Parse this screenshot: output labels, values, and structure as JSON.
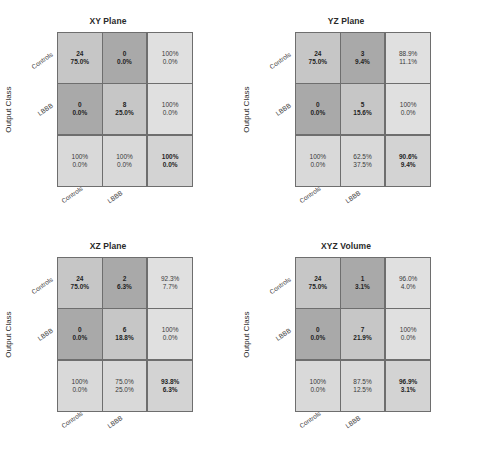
{
  "page": {
    "header_text": "",
    "y_axis_label": "Output Class",
    "class_labels": [
      "Controls",
      "LBBB"
    ]
  },
  "chart_data": {
    "type": "table",
    "xlabel": "Target Class",
    "ylabel": "Output Class",
    "categories": [
      "Controls",
      "LBBB"
    ],
    "legend": [],
    "panels": [
      {
        "title": "XY Plane",
        "cells": [
          [
            {
              "v1": "24",
              "v2": "75.0%",
              "shade": "diag"
            },
            {
              "v1": "0",
              "v2": "0.0%",
              "shade": "off"
            },
            {
              "v1": "100%",
              "v2": "0.0%",
              "shade": "margin-lt"
            }
          ],
          [
            {
              "v1": "0",
              "v2": "0.0%",
              "shade": "off"
            },
            {
              "v1": "8",
              "v2": "25.0%",
              "shade": "diag"
            },
            {
              "v1": "100%",
              "v2": "0.0%",
              "shade": "margin-lt"
            }
          ],
          [
            {
              "v1": "100%",
              "v2": "0.0%",
              "shade": "margin"
            },
            {
              "v1": "100%",
              "v2": "0.0%",
              "shade": "margin"
            },
            {
              "v1": "100%",
              "v2": "0.0%",
              "shade": "total"
            }
          ]
        ]
      },
      {
        "title": "YZ Plane",
        "cells": [
          [
            {
              "v1": "24",
              "v2": "75.0%",
              "shade": "diag"
            },
            {
              "v1": "3",
              "v2": "9.4%",
              "shade": "off"
            },
            {
              "v1": "88.9%",
              "v2": "11.1%",
              "shade": "margin-lt"
            }
          ],
          [
            {
              "v1": "0",
              "v2": "0.0%",
              "shade": "off"
            },
            {
              "v1": "5",
              "v2": "15.6%",
              "shade": "diag"
            },
            {
              "v1": "100%",
              "v2": "0.0%",
              "shade": "margin-lt"
            }
          ],
          [
            {
              "v1": "100%",
              "v2": "0.0%",
              "shade": "margin"
            },
            {
              "v1": "62.5%",
              "v2": "37.5%",
              "shade": "margin"
            },
            {
              "v1": "90.6%",
              "v2": "9.4%",
              "shade": "total"
            }
          ]
        ]
      },
      {
        "title": "XZ Plane",
        "cells": [
          [
            {
              "v1": "24",
              "v2": "75.0%",
              "shade": "diag"
            },
            {
              "v1": "2",
              "v2": "6.3%",
              "shade": "off"
            },
            {
              "v1": "92.3%",
              "v2": "7.7%",
              "shade": "margin-lt"
            }
          ],
          [
            {
              "v1": "0",
              "v2": "0.0%",
              "shade": "off"
            },
            {
              "v1": "6",
              "v2": "18.8%",
              "shade": "diag"
            },
            {
              "v1": "100%",
              "v2": "0.0%",
              "shade": "margin-lt"
            }
          ],
          [
            {
              "v1": "100%",
              "v2": "0.0%",
              "shade": "margin"
            },
            {
              "v1": "75.0%",
              "v2": "25.0%",
              "shade": "margin"
            },
            {
              "v1": "93.8%",
              "v2": "6.3%",
              "shade": "total"
            }
          ]
        ]
      },
      {
        "title": "XYZ Volume",
        "cells": [
          [
            {
              "v1": "24",
              "v2": "75.0%",
              "shade": "diag"
            },
            {
              "v1": "1",
              "v2": "3.1%",
              "shade": "off"
            },
            {
              "v1": "96.0%",
              "v2": "4.0%",
              "shade": "margin-lt"
            }
          ],
          [
            {
              "v1": "0",
              "v2": "0.0%",
              "shade": "off"
            },
            {
              "v1": "7",
              "v2": "21.9%",
              "shade": "diag"
            },
            {
              "v1": "100%",
              "v2": "0.0%",
              "shade": "margin-lt"
            }
          ],
          [
            {
              "v1": "100%",
              "v2": "0.0%",
              "shade": "margin"
            },
            {
              "v1": "87.5%",
              "v2": "12.5%",
              "shade": "margin"
            },
            {
              "v1": "96.9%",
              "v2": "3.1%",
              "shade": "total"
            }
          ]
        ]
      }
    ]
  },
  "colors": {
    "diagonal_cell": "#c6c6c6",
    "offdiagonal_cell": "#a9a9a9",
    "margin_cell": "#d9d9d9",
    "margin_cell_light": "#e0e0e0",
    "total_cell": "#d3d3d3",
    "grid_line": "#6e6e6e",
    "text": "#1f1f1f",
    "background": "#ffffff"
  }
}
